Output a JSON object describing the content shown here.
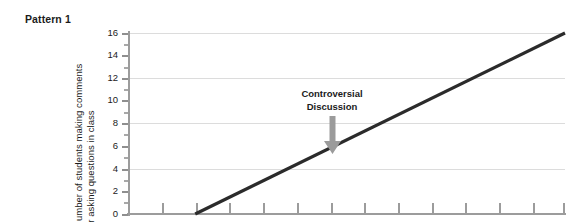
{
  "chart_data": {
    "type": "line",
    "title": "Pattern 1",
    "xlabel": "",
    "ylabel": "Number of students making comments or asking questions in class",
    "ylabel_line1": "Number of students making comments",
    "ylabel_line2": "or asking questions in class",
    "ylim": [
      0,
      16
    ],
    "ytick_labels": [
      "16",
      "14",
      "12",
      "10",
      "8",
      "6",
      "4",
      "2",
      "0"
    ],
    "ytick_values": [
      16,
      14,
      12,
      10,
      8,
      6,
      4,
      2,
      0
    ],
    "yminor_values": [
      15,
      13,
      11,
      9,
      7,
      5,
      3,
      1
    ],
    "gridline_values": [
      16,
      12,
      8,
      4
    ],
    "grid": true,
    "legend": "none",
    "xtick_count": 14,
    "series": [
      {
        "name": "students commenting",
        "x": [
          2,
          13
        ],
        "values": [
          0,
          16
        ],
        "color": "#2b2b2b"
      }
    ],
    "annotations": [
      {
        "text_line1": "Controversial",
        "text_line2": "Discussion",
        "arrow": "down-arrow",
        "arrow_color": "#9b9b9b",
        "target_x": 8,
        "target_y": 6
      }
    ]
  },
  "colors": {
    "series_line": "#2b2b2b",
    "gridline": "#dcdcdc",
    "axis": "#9c9c9c",
    "annotation_arrow": "#9b9b9b",
    "text": "#1b1b1b",
    "background": "#ffffff"
  }
}
